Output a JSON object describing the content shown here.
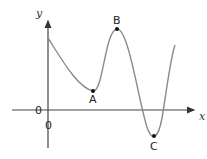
{
  "diagram": {
    "title": "",
    "axes": {
      "x_label": "x",
      "y_label": "y",
      "origin_labels": [
        "0",
        "0"
      ]
    },
    "points": [
      {
        "label": "A",
        "kind": "local minimum"
      },
      {
        "label": "B",
        "kind": "local maximum"
      },
      {
        "label": "C",
        "kind": "local minimum (below x-axis)"
      }
    ],
    "colors": {
      "curve": "#8a8a8a",
      "axes": "#333333",
      "points": "#111111"
    }
  }
}
